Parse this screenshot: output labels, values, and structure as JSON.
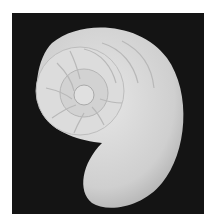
{
  "image": {
    "subject": "nautilus shell",
    "alt": "Black and white photograph of a nautilus shell cross-section on a dark background",
    "colors": {
      "background": "#ffffff",
      "photo_bg": "#141414",
      "shell": "#d8d8d8",
      "shell_shadow": "#b0b0b0"
    }
  }
}
